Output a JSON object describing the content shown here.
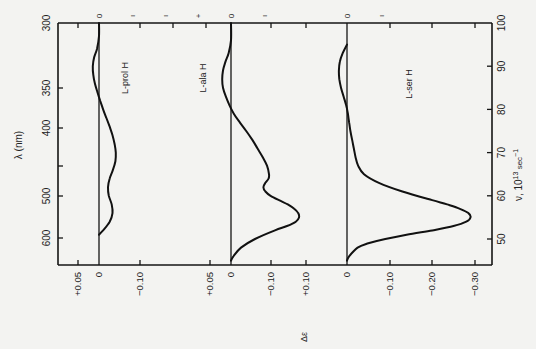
{
  "chart_data": {
    "type": "line",
    "orientation": "rotated-90",
    "title": "",
    "xlabel_left": "λ (nm)",
    "xlabel_right": "ν, 10^13 sec^-1",
    "ylabel": "Δε",
    "left_axis": {
      "label": "λ (nm)",
      "ticks": [
        "300",
        "350",
        "400",
        "500",
        "600"
      ],
      "tick_values": [
        300,
        350,
        400,
        500,
        600
      ]
    },
    "right_axis": {
      "label": "ν, 10^13 sec^-1",
      "ticks": [
        "100",
        "90",
        "80",
        "70",
        "60",
        "50"
      ],
      "tick_values": [
        100,
        90,
        80,
        70,
        60,
        50
      ],
      "range": [
        45,
        100
      ]
    },
    "panels": [
      {
        "name": "L-prol H",
        "y_ticks": [
          "+0.05",
          "0",
          "-0.10"
        ],
        "y_tick_values": [
          0.05,
          0,
          -0.1
        ],
        "series": {
          "name": "L-prol H",
          "x_nu": [
            100,
            97,
            94,
            92,
            90,
            88,
            86,
            84,
            82,
            80,
            78,
            76,
            74,
            72,
            70,
            68,
            66,
            64,
            62,
            60,
            58,
            56,
            54,
            52,
            51
          ],
          "y": [
            0.0,
            0.0,
            0.005,
            0.012,
            0.015,
            0.014,
            0.01,
            0.004,
            -0.003,
            -0.01,
            -0.018,
            -0.026,
            -0.033,
            -0.038,
            -0.041,
            -0.04,
            -0.034,
            -0.026,
            -0.022,
            -0.024,
            -0.031,
            -0.033,
            -0.026,
            -0.01,
            0.0
          ]
        }
      },
      {
        "name": "L-ala H",
        "y_ticks": [
          "+0.05",
          "0",
          "-0.10",
          "+0.10"
        ],
        "y_tick_values": [
          0.05,
          0,
          -0.1
        ],
        "series": {
          "name": "L-ala H",
          "x_nu": [
            100,
            96,
            93,
            91,
            89,
            87,
            85,
            83,
            81,
            79,
            77,
            75,
            73,
            71,
            69,
            67,
            65,
            64,
            63,
            62,
            61,
            60,
            59,
            58,
            57,
            56,
            55,
            54,
            53,
            52,
            50,
            48,
            46,
            45
          ],
          "y": [
            0.0,
            0.0,
            0.006,
            0.014,
            0.02,
            0.022,
            0.02,
            0.013,
            0.004,
            -0.007,
            -0.022,
            -0.038,
            -0.053,
            -0.066,
            -0.079,
            -0.09,
            -0.095,
            -0.094,
            -0.086,
            -0.081,
            -0.086,
            -0.099,
            -0.12,
            -0.142,
            -0.158,
            -0.168,
            -0.17,
            -0.162,
            -0.14,
            -0.11,
            -0.06,
            -0.025,
            -0.006,
            0.0
          ]
        }
      },
      {
        "name": "L-ser H",
        "y_ticks": [
          "0",
          "-0.10",
          "-0.20",
          "-0.30"
        ],
        "y_tick_values": [
          0,
          -0.1,
          -0.2,
          -0.3
        ],
        "series": {
          "name": "L-ser H",
          "x_nu": [
            95,
            93,
            91,
            89,
            87,
            85,
            83,
            81,
            79,
            77,
            75,
            73,
            71,
            69,
            67,
            65,
            63,
            61,
            59,
            58,
            57,
            56,
            55,
            54,
            53,
            52,
            51,
            50,
            49,
            48,
            46,
            45
          ],
          "y": [
            0.0,
            0.01,
            0.017,
            0.019,
            0.018,
            0.014,
            0.008,
            0.002,
            -0.002,
            -0.005,
            -0.008,
            -0.012,
            -0.016,
            -0.02,
            -0.026,
            -0.04,
            -0.075,
            -0.13,
            -0.2,
            -0.235,
            -0.265,
            -0.285,
            -0.29,
            -0.28,
            -0.25,
            -0.2,
            -0.14,
            -0.09,
            -0.05,
            -0.025,
            -0.005,
            0.0
          ]
        }
      }
    ],
    "grid": false,
    "legend": "inline labels per panel"
  },
  "labels": {
    "left_axis_title": "λ (nm)",
    "right_axis_title_nu": "ν, 10",
    "right_axis_title_exp": "13",
    "right_axis_title_unit": " sec",
    "right_axis_title_unit_exp": "−1",
    "bottom_axis_title": "Δε",
    "panel_prol": "L-prol H",
    "panel_ala": "L-ala H",
    "panel_ser": "L-ser H"
  }
}
